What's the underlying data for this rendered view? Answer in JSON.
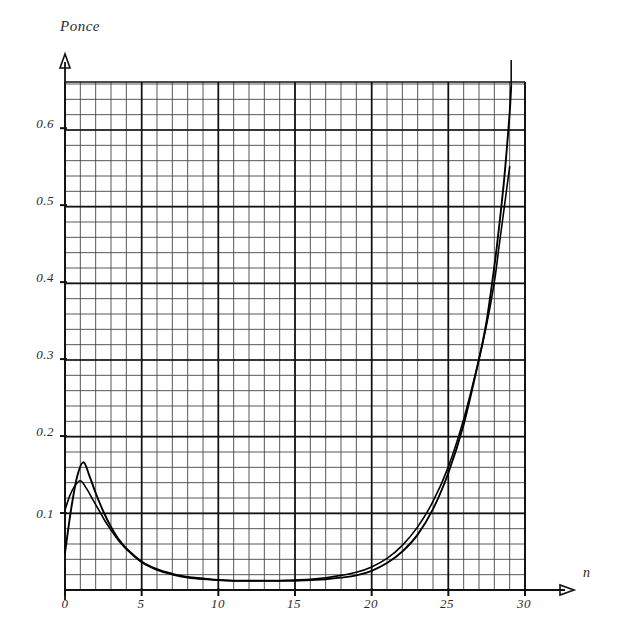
{
  "chart_data": {
    "type": "line",
    "title": "Ponce",
    "xlabel": "n",
    "ylabel": "",
    "xlim": [
      0,
      30
    ],
    "ylim": [
      0,
      0.68
    ],
    "grid": true,
    "grid_style": "graph-paper minor+major",
    "legend": "none",
    "xticks": [
      0,
      5,
      10,
      15,
      20,
      25,
      30
    ],
    "xtick_labels": [
      "0",
      "5",
      "10",
      "15",
      "20",
      "25",
      "30"
    ],
    "yticks": [
      0.1,
      0.2,
      0.3,
      0.4,
      0.5,
      0.6
    ],
    "ytick_labels": [
      "0.1",
      "0.2",
      "0.3",
      "0.4",
      "0.5",
      "0.6"
    ],
    "series": [
      {
        "name": "curve-1",
        "color": "#000000",
        "x": [
          0,
          0.4,
          0.8,
          1.2,
          1.6,
          2,
          2.5,
          3,
          3.5,
          4,
          5,
          6,
          7,
          8,
          9,
          10,
          11,
          12,
          13,
          14,
          15,
          16,
          17,
          18,
          19,
          20,
          21,
          22,
          23,
          24,
          25,
          26,
          27,
          27.5,
          28,
          28.3,
          28.6,
          28.8,
          29,
          29.1
        ],
        "y": [
          0.048,
          0.105,
          0.148,
          0.166,
          0.148,
          0.126,
          0.102,
          0.082,
          0.066,
          0.054,
          0.037,
          0.027,
          0.021,
          0.017,
          0.015,
          0.013,
          0.012,
          0.012,
          0.012,
          0.012,
          0.012,
          0.013,
          0.014,
          0.016,
          0.019,
          0.025,
          0.035,
          0.05,
          0.072,
          0.105,
          0.152,
          0.215,
          0.3,
          0.35,
          0.42,
          0.47,
          0.525,
          0.57,
          0.62,
          0.655
        ]
      },
      {
        "name": "curve-2",
        "color": "#000000",
        "x": [
          0,
          0.3,
          0.6,
          1,
          1.4,
          1.8,
          2.2,
          2.6,
          3,
          3.5,
          4,
          5,
          6,
          7,
          8,
          9,
          10,
          11,
          12,
          13,
          14,
          15,
          16,
          17,
          18,
          19,
          20,
          21,
          22,
          23,
          24,
          25,
          26,
          27,
          27.5,
          28,
          28.3,
          28.6,
          28.8,
          29
        ],
        "y": [
          0.104,
          0.122,
          0.134,
          0.142,
          0.132,
          0.118,
          0.104,
          0.09,
          0.078,
          0.064,
          0.053,
          0.036,
          0.026,
          0.02,
          0.016,
          0.014,
          0.013,
          0.012,
          0.012,
          0.012,
          0.012,
          0.013,
          0.014,
          0.016,
          0.019,
          0.023,
          0.03,
          0.041,
          0.058,
          0.082,
          0.115,
          0.16,
          0.222,
          0.3,
          0.345,
          0.4,
          0.445,
          0.49,
          0.52,
          0.55
        ]
      }
    ],
    "annotations": []
  },
  "axes": {
    "y_arrow": "up-arrow-head",
    "x_arrow": "right-arrow-head"
  }
}
